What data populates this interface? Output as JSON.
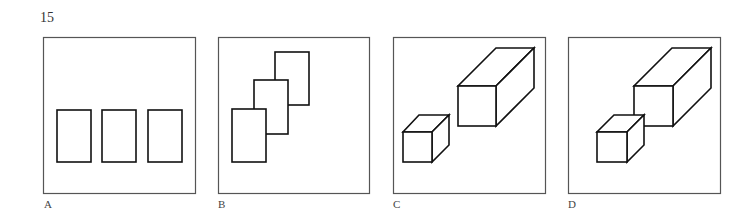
{
  "figure": {
    "number": "15",
    "panels": [
      {
        "id": "A",
        "label": "A",
        "description": "three separate rectangles in a row"
      },
      {
        "id": "B",
        "label": "B",
        "description": "three overlapping rectangles ascending diagonally"
      },
      {
        "id": "C",
        "label": "C",
        "description": "small cube and large rectangular box, separated"
      },
      {
        "id": "D",
        "label": "D",
        "description": "small cube overlapping large rectangular box"
      }
    ]
  },
  "colors": {
    "line": "#111111",
    "frame": "#555555",
    "background": "#ffffff"
  }
}
